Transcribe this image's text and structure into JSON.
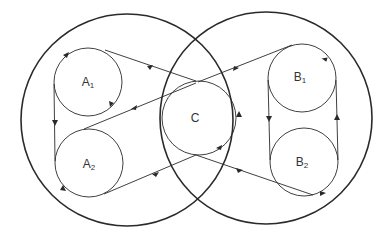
{
  "diagram": {
    "type": "venn-with-cycles",
    "colors": {
      "stroke": "#2a2a2a",
      "background": "#ffffff"
    },
    "outer_sets": [
      {
        "id": "left",
        "cx": 127,
        "cy": 120,
        "r": 106
      },
      {
        "id": "right",
        "cx": 266,
        "cy": 118,
        "r": 106
      }
    ],
    "nodes": [
      {
        "id": "A1",
        "letter": "A",
        "sub": "1",
        "cx": 88,
        "cy": 82,
        "r": 34
      },
      {
        "id": "A2",
        "letter": "A",
        "sub": "2",
        "cx": 89,
        "cy": 163,
        "r": 34
      },
      {
        "id": "C",
        "letter": "C",
        "sub": "",
        "cx": 199,
        "cy": 118,
        "r": 37
      },
      {
        "id": "B1",
        "letter": "B",
        "sub": "1",
        "cx": 302,
        "cy": 78,
        "r": 34
      },
      {
        "id": "B2",
        "letter": "B",
        "sub": "2",
        "cx": 304,
        "cy": 162,
        "r": 34
      }
    ],
    "labels": {
      "A1": {
        "letter": "A",
        "sub": "1"
      },
      "A2": {
        "letter": "A",
        "sub": "2"
      },
      "C": {
        "letter": "C"
      },
      "B1": {
        "letter": "B",
        "sub": "1"
      },
      "B2": {
        "letter": "B",
        "sub": "2"
      }
    }
  }
}
